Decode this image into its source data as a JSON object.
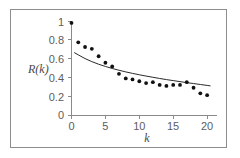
{
  "chart_data": {
    "type": "scatter",
    "title": "",
    "subtitle": "",
    "xlabel": "k",
    "ylabel": "R(k)",
    "xlim": [
      0,
      21
    ],
    "ylim": [
      0,
      1.05
    ],
    "grid": false,
    "legend": "none",
    "xticks": [
      0,
      5,
      10,
      15,
      20
    ],
    "xtick_labels": [
      "0",
      "5",
      "10",
      "15",
      "20"
    ],
    "yticks": [
      0,
      0.2,
      0.4,
      0.6,
      0.8,
      1
    ],
    "ytick_labels": [
      "0",
      "0.2",
      "0.4",
      "0.6",
      "0.8",
      "1"
    ],
    "series": [
      {
        "name": "R(k) measured",
        "kind": "scatter",
        "marker": "filled-circle",
        "color": "#111111",
        "x": [
          0,
          1,
          2,
          3,
          4,
          5,
          6,
          7,
          8,
          9,
          10,
          11,
          12,
          13,
          14,
          15,
          16,
          17,
          18,
          19,
          20
        ],
        "y": [
          1.0,
          0.79,
          0.74,
          0.72,
          0.64,
          0.57,
          0.53,
          0.45,
          0.4,
          0.39,
          0.37,
          0.35,
          0.36,
          0.33,
          0.32,
          0.33,
          0.33,
          0.36,
          0.3,
          0.24,
          0.22
        ]
      },
      {
        "name": "fitted decay curve",
        "kind": "line",
        "color": "#2b2b2b",
        "x": [
          0.4,
          1,
          2,
          3,
          4,
          5,
          6,
          7,
          8,
          9,
          10,
          11,
          12,
          13,
          14,
          15,
          16,
          17,
          18,
          19,
          20,
          20.5
        ],
        "y": [
          0.68,
          0.655,
          0.615,
          0.582,
          0.554,
          0.53,
          0.508,
          0.489,
          0.471,
          0.455,
          0.44,
          0.426,
          0.413,
          0.4,
          0.388,
          0.377,
          0.366,
          0.355,
          0.345,
          0.335,
          0.325,
          0.32
        ]
      }
    ]
  },
  "axes": {
    "y_label_text": "R(k)",
    "x_label_text": "k"
  }
}
